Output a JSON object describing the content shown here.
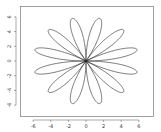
{
  "chart_data": {
    "type": "line",
    "title": "",
    "xlabel": "",
    "ylabel": "",
    "curve": {
      "kind": "rose",
      "amplitude": 6,
      "k": 6,
      "function": "sin",
      "theta_range": [
        0,
        6.283185307
      ]
    },
    "x_ticks": [
      -6,
      -4,
      -2,
      0,
      2,
      4,
      6
    ],
    "y_ticks": [
      -6,
      -4,
      -2,
      0,
      2,
      4,
      6
    ],
    "x_tick_labels": [
      "-6",
      "-4",
      "-2",
      "0",
      "2",
      "4",
      "6"
    ],
    "y_tick_labels": [
      "-6",
      "-4",
      "-2",
      "0",
      "2",
      "4",
      "6"
    ],
    "xlim": [
      -7.5,
      7.6
    ],
    "ylim": [
      -7.4,
      7.5
    ],
    "grid": false,
    "legend": null,
    "series": [
      {
        "name": "rose",
        "color": "#222222",
        "petals": 12,
        "petal_angles_deg": [
          15,
          45,
          75,
          105,
          135,
          165,
          195,
          225,
          255,
          285,
          315,
          345
        ],
        "max_radius": 6
      }
    ]
  },
  "colors": {
    "line": "#222222",
    "axis": "#555555",
    "background": "#ffffff"
  }
}
